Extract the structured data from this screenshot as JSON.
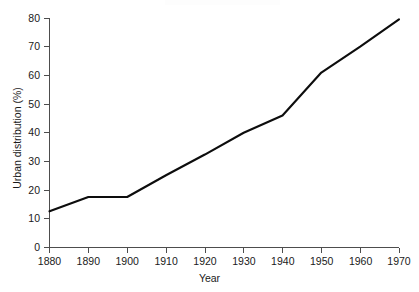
{
  "chart_data": {
    "type": "line",
    "title": "",
    "subtitle": "",
    "xlabel": "Year",
    "ylabel": "Urban distribution (%)",
    "xlim": [
      1880,
      1970
    ],
    "ylim": [
      0,
      80
    ],
    "xticks": [
      1880,
      1890,
      1900,
      1910,
      1920,
      1930,
      1940,
      1950,
      1960,
      1970
    ],
    "xtick_labels": [
      "1880",
      "1890",
      "1900",
      "1910",
      "1920",
      "1930",
      "1940",
      "1950",
      "1960",
      "1970"
    ],
    "yticks": [
      0,
      10,
      20,
      30,
      40,
      50,
      60,
      70,
      80
    ],
    "ytick_labels": [
      "0",
      "10",
      "20",
      "30",
      "40",
      "50",
      "60",
      "70",
      "80"
    ],
    "grid": false,
    "legend": false,
    "legend_position": "none",
    "line_color": "#0d0d0d",
    "axis_color": "#4d4d4d",
    "background_color": "#ffffff",
    "x": [
      1880,
      1890,
      1900,
      1910,
      1920,
      1930,
      1940,
      1945,
      1950,
      1960,
      1970
    ],
    "series": [
      {
        "name": "Urban distribution",
        "values": [
          12.6,
          17.6,
          17.6,
          25.2,
          32.4,
          40.0,
          46.0,
          53.5,
          61.0,
          70.0,
          79.5
        ]
      }
    ]
  },
  "axes": {
    "x_title": "Year",
    "y_title": "Urban distribution (%)"
  }
}
